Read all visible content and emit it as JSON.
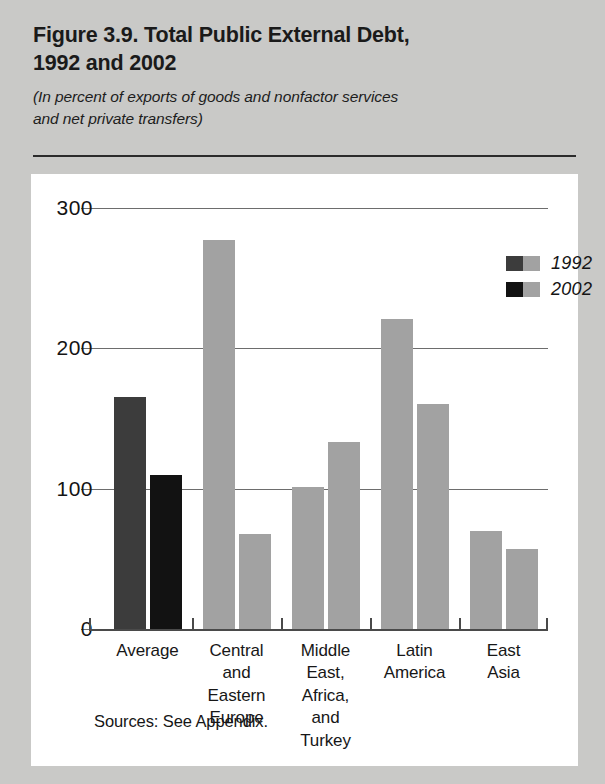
{
  "figure": {
    "title": "Figure 3.9. Total Public External Debt, 1992 and 2002",
    "title_line1": "Figure 3.9. Total Public External Debt,",
    "title_line2": "1992 and 2002",
    "subtitle_line1": "(In percent of exports of goods and nonfactor services",
    "subtitle_line2": "and net private transfers)",
    "source": "Sources: See Appendix."
  },
  "chart_data": {
    "type": "bar",
    "title": "Figure 3.9. Total Public External Debt, 1992 and 2002",
    "subtitle": "(In percent of exports of goods and nonfactor services and net private transfers)",
    "xlabel": "",
    "ylabel": "",
    "ylim": [
      0,
      300
    ],
    "yticks": [
      0,
      100,
      200,
      300
    ],
    "ytick_labels": [
      "0",
      "100",
      "200",
      "300"
    ],
    "grid": true,
    "grid_axis": "y",
    "legend_position": "top-right",
    "categories": [
      "Average",
      "Central and Eastern Europe",
      "Middle East, Africa, and Turkey",
      "Latin America",
      "East Asia"
    ],
    "category_label_lines": [
      [
        "Average"
      ],
      [
        "Central",
        "and",
        "Eastern",
        "Europe"
      ],
      [
        "Middle",
        "East,",
        "Africa,",
        "and",
        "Turkey"
      ],
      [
        "Latin",
        "America"
      ],
      [
        "East",
        "Asia"
      ]
    ],
    "series": [
      {
        "name": "1992",
        "values": [
          165,
          277,
          101,
          221,
          70
        ],
        "colors": [
          "#3c3c3c",
          "#a2a2a2",
          "#a2a2a2",
          "#a2a2a2",
          "#a2a2a2"
        ]
      },
      {
        "name": "2002",
        "values": [
          110,
          68,
          133,
          160,
          57
        ],
        "colors": [
          "#121212",
          "#a2a2a2",
          "#a2a2a2",
          "#a2a2a2",
          "#a2a2a2"
        ]
      }
    ]
  },
  "legend": {
    "entries": [
      {
        "label": "1992",
        "dark_color": "#3c3c3c",
        "light_color": "#a2a2a2"
      },
      {
        "label": "2002",
        "dark_color": "#121212",
        "light_color": "#a2a2a2"
      }
    ]
  },
  "colors": {
    "page_background": "#c9c9c7",
    "panel_background": "#ffffff",
    "bar_gray": "#a2a2a2",
    "bar_dark_gray": "#3c3c3c",
    "bar_black": "#121212",
    "gridline": "#6d6d6d",
    "text": "#171717"
  }
}
